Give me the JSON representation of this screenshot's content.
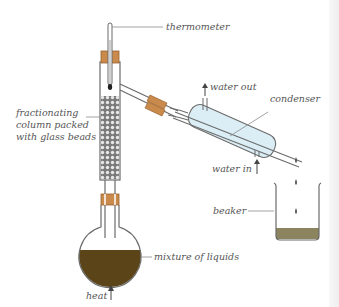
{
  "diagram": {
    "labels": {
      "thermometer": "thermometer",
      "column_line1": "fractionating",
      "column_line2": "column packed",
      "column_line3": "with glass beads",
      "water_out": "water out",
      "condenser": "condenser",
      "water_in": "water in",
      "beaker": "beaker",
      "mixture": "mixture of liquids",
      "heat": "heat"
    },
    "colors": {
      "glass_outline": "#6b6b6b",
      "cork": "#c98a4b",
      "cork_dark": "#9a6330",
      "mixture_liquid": "#5a4418",
      "distillate_liquid": "#8c835f",
      "condenser_water": "#dbeef6",
      "beads": "#555555",
      "label_text": "#555555",
      "leader_line": "#8a8a8a"
    },
    "components": [
      "thermometer",
      "fractionating-column",
      "round-bottom-flask",
      "condenser",
      "beaker",
      "heat-arrow"
    ]
  }
}
